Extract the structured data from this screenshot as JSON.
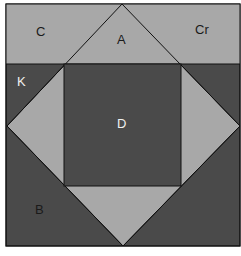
{
  "diagram": {
    "colors": {
      "light": "#a8a8a8",
      "dark": "#4a4a4a",
      "line": "#111111",
      "label_dark": "#1a1a1a",
      "label_light": "#f0f0f0"
    },
    "labels": {
      "C": "C",
      "A": "A",
      "Cr": "Cr",
      "K": "K",
      "D": "D",
      "B": "B"
    }
  }
}
